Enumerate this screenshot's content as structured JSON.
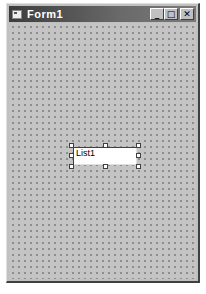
{
  "window": {
    "title": "Form1",
    "icon": "form-icon",
    "buttons": [
      {
        "name": "minimize",
        "glyph": "_"
      },
      {
        "name": "maximize",
        "glyph": "□"
      },
      {
        "name": "close",
        "glyph": "✕"
      }
    ]
  },
  "form": {
    "grid": "dotted",
    "controls": [
      {
        "type": "ListBox",
        "label": "List1",
        "selected": true
      }
    ]
  }
}
